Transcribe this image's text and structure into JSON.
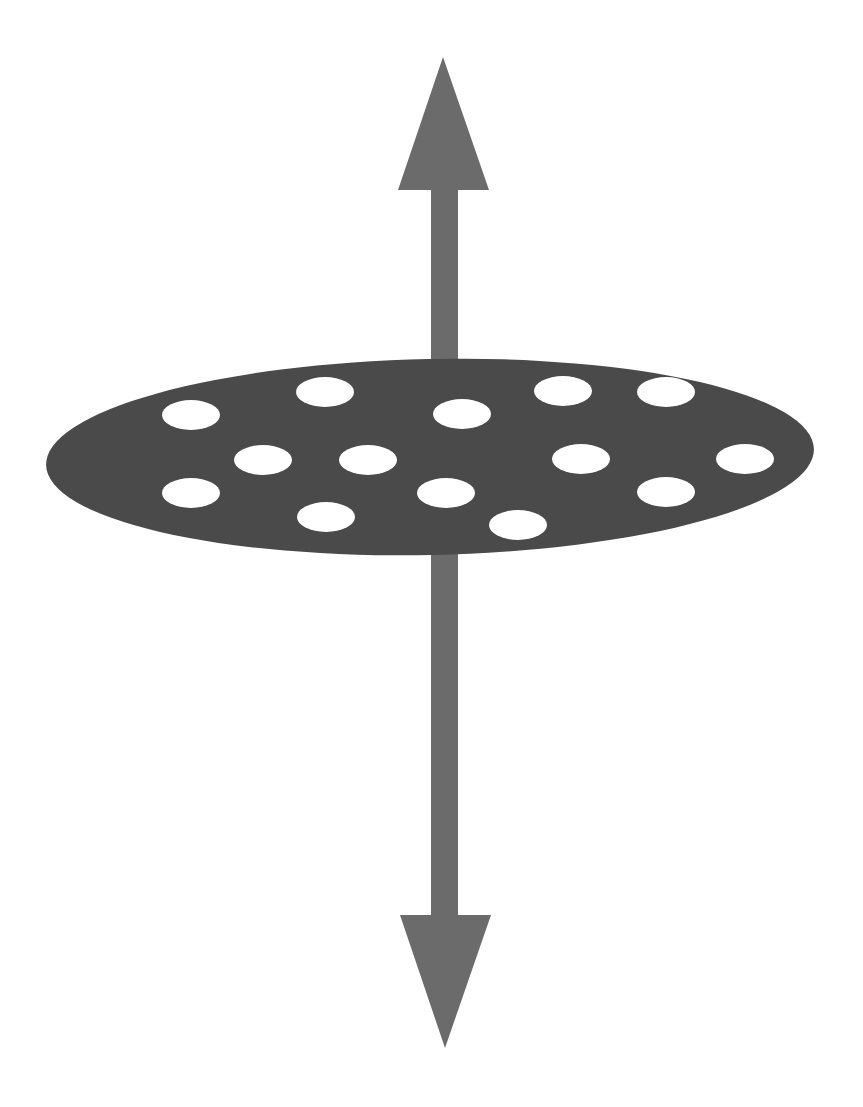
{
  "diagram": {
    "background": "#ffffff",
    "colors": {
      "arrow": "#6b6b6b",
      "disc": "#4a4a4a",
      "holes": "#ffffff"
    },
    "arrow": {
      "direction": "bidirectional-vertical",
      "shaft_x1": 431,
      "shaft_x2": 458,
      "top_head": {
        "tip": [
          443,
          57
        ],
        "base_y": 190,
        "base_left": 398,
        "base_right": 489
      },
      "bottom_head": {
        "tip": [
          445,
          1048
        ],
        "base_y": 915,
        "base_left": 400,
        "base_right": 491
      }
    },
    "disc": {
      "cx": 430,
      "cy": 457,
      "rx": 384,
      "ry": 98,
      "rotate": -1.2
    },
    "holes": [
      {
        "cx": 191,
        "cy": 415
      },
      {
        "cx": 325,
        "cy": 392
      },
      {
        "cx": 462,
        "cy": 414
      },
      {
        "cx": 563,
        "cy": 391
      },
      {
        "cx": 666,
        "cy": 392
      },
      {
        "cx": 263,
        "cy": 460
      },
      {
        "cx": 368,
        "cy": 460
      },
      {
        "cx": 581,
        "cy": 459
      },
      {
        "cx": 745,
        "cy": 459
      },
      {
        "cx": 191,
        "cy": 493
      },
      {
        "cx": 446,
        "cy": 493
      },
      {
        "cx": 666,
        "cy": 492
      },
      {
        "cx": 326,
        "cy": 517
      },
      {
        "cx": 518,
        "cy": 525
      }
    ],
    "hole_rx": 29,
    "hole_ry": 15
  }
}
